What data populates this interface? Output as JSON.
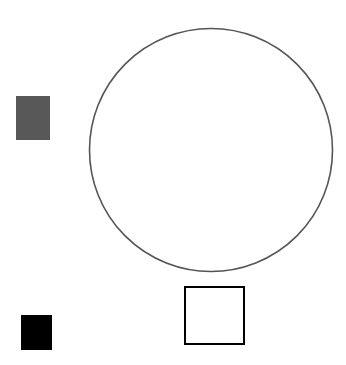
{
  "canvas": {
    "width": 346,
    "height": 365,
    "background_color": "#ffffff",
    "title": "Geometric shapes figure"
  },
  "shapes": [
    {
      "id": "gray-square",
      "kind": "square",
      "style": "filled",
      "label": "Gray filled square",
      "x": 16,
      "y": 96,
      "width": 34,
      "height": 44,
      "fill_color": "#585858",
      "stroke_color": "none",
      "stroke_width": 0
    },
    {
      "id": "black-square",
      "kind": "square",
      "style": "filled",
      "label": "Black filled square",
      "x": 21,
      "y": 315,
      "width": 31,
      "height": 35,
      "fill_color": "#000000",
      "stroke_color": "none",
      "stroke_width": 0
    },
    {
      "id": "circle-outline",
      "kind": "circle",
      "style": "outlined",
      "label": "Large circle outline",
      "center_x": 211,
      "center_y": 150,
      "radius": 121.5,
      "fill_color": "none",
      "stroke_color": "#555555",
      "stroke_width": 1.6
    },
    {
      "id": "outlined-square",
      "kind": "square",
      "style": "outlined",
      "label": "Black outlined square",
      "x": 184,
      "y": 286,
      "width": 61,
      "height": 59,
      "fill_color": "#ffffff",
      "stroke_color": "#000000",
      "stroke_width": 2.5
    }
  ]
}
